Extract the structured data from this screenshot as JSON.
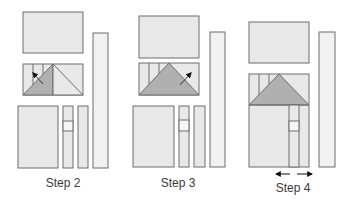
{
  "colors": {
    "fill_light": "#e8e8e8",
    "fill_bar": "#f1f1f1",
    "fill_dark": "#b0b0b0",
    "stroke": "#6d6d6d",
    "band": "#f6f6f6"
  },
  "steps": [
    {
      "label": "Step 2"
    },
    {
      "label": "Step 3"
    },
    {
      "label": "Step 4"
    }
  ]
}
